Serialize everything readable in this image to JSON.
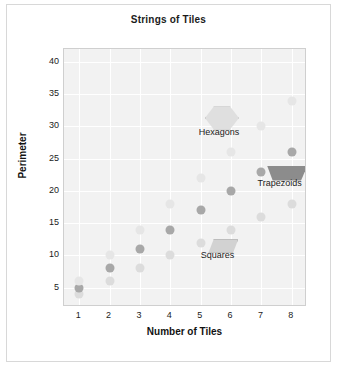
{
  "chart_data": {
    "type": "scatter",
    "title": "Strings of Tiles",
    "xlabel": "Number of Tiles",
    "ylabel": "Perimeter",
    "x": [
      1,
      2,
      3,
      4,
      5,
      6,
      7,
      8
    ],
    "xticks": [
      "1",
      "2",
      "3",
      "4",
      "5",
      "6",
      "7",
      "8"
    ],
    "yticks": [
      "5",
      "10",
      "15",
      "20",
      "25",
      "30",
      "35",
      "40"
    ],
    "xlim": [
      0.5,
      8.5
    ],
    "ylim": [
      2,
      42
    ],
    "grid": true,
    "legend_position": "inline-annotations",
    "series": [
      {
        "name": "Squares",
        "color": "#dcdcdc",
        "formula": "2n + 2",
        "values": [
          4,
          6,
          8,
          10,
          12,
          14,
          16,
          18
        ]
      },
      {
        "name": "Trapezoids",
        "color": "#a8a8a8",
        "formula": "3n + 2",
        "values": [
          5,
          8,
          11,
          14,
          17,
          20,
          23,
          26
        ]
      },
      {
        "name": "Hexagons",
        "color": "#e6e6e6",
        "formula": "4n + 2",
        "values": [
          6,
          10,
          14,
          18,
          22,
          26,
          30,
          34
        ]
      }
    ],
    "annotations": [
      {
        "label": "Hexagons",
        "x": 5.6,
        "y": 29.0,
        "icon": "hexagon-tile-icon",
        "icon_x": 5.7,
        "icon_y": 31.3
      },
      {
        "label": "Trapezoids",
        "x": 7.6,
        "y": 21.0,
        "icon": "trapezoid-tile-icon",
        "icon_x": 7.85,
        "icon_y": 22.7
      },
      {
        "label": "Squares",
        "x": 5.55,
        "y": 9.9,
        "icon": "square-tile-icon",
        "icon_x": 5.75,
        "icon_y": 11.5
      }
    ]
  }
}
